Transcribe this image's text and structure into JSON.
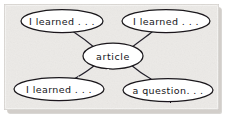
{
  "panel": {
    "background_color": "#eceae7",
    "border_color": "#c9c6c1",
    "shadow_color": "#b9b6b1",
    "width": 227,
    "height": 118
  },
  "diagram": {
    "type": "concept-map",
    "style": "hand-drawn-sketch",
    "ink_color": "#1a181c",
    "node_fill": "#ffffff",
    "center_node": {
      "id": "article",
      "label": "article",
      "cx": 113,
      "cy": 56,
      "rx": 30,
      "ry": 13
    },
    "nodes": [
      {
        "id": "top-left",
        "label": "I learned . . .",
        "position": "top-left",
        "cx": 62,
        "cy": 21,
        "rx": 41,
        "ry": 11.5
      },
      {
        "id": "top-right",
        "label": "I learned . . .",
        "position": "top-right",
        "cx": 166,
        "cy": 21,
        "rx": 44,
        "ry": 11.5
      },
      {
        "id": "bottom-left",
        "label": "I learned . . .",
        "position": "bottom-left",
        "cx": 59,
        "cy": 89,
        "rx": 45,
        "ry": 11.5
      },
      {
        "id": "bottom-right",
        "label": "a question. . .",
        "position": "bottom-right",
        "cx": 168,
        "cy": 90,
        "rx": 45,
        "ry": 11.5
      }
    ],
    "edges": [
      {
        "from": "article",
        "to": "top-left"
      },
      {
        "from": "article",
        "to": "top-right"
      },
      {
        "from": "article",
        "to": "bottom-left"
      },
      {
        "from": "article",
        "to": "bottom-right"
      }
    ]
  }
}
